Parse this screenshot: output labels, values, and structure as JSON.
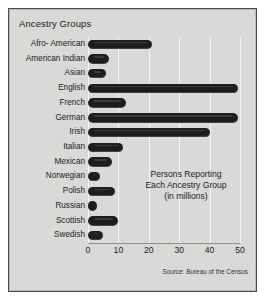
{
  "chart": {
    "title": "Ancestry Groups",
    "annotation_lines": [
      "Persons Reporting",
      "Each Ancestry Group",
      "(in millions)"
    ],
    "source": "Source: Bureau of the Census",
    "bar_color": "#1d1d1d",
    "panel_color": "#d9d9d7",
    "gridline_color": "#f4f4f2",
    "border_color": "#4a4a48"
  },
  "chart_data": {
    "type": "bar",
    "orientation": "horizontal",
    "title": "Ancestry Groups",
    "xlabel": "",
    "ylabel": "",
    "annotation": "Persons Reporting Each Ancestry Group (in millions)",
    "source": "Source: Bureau of the Census",
    "xlim": [
      0,
      50
    ],
    "xticks": [
      0,
      10,
      20,
      30,
      40,
      50
    ],
    "xtick_labels": [
      "0",
      "10",
      "20",
      "30",
      "40",
      "50"
    ],
    "grid": true,
    "legend": false,
    "units": "millions of persons",
    "categories": [
      "Afro- American",
      "American Indian",
      "Asian",
      "English",
      "French",
      "German",
      "Irish",
      "Italian",
      "Mexican",
      "Norwegian",
      "Polish",
      "Russian",
      "Scottish",
      "Swedish"
    ],
    "values": [
      21,
      7,
      6,
      49.5,
      12.5,
      49.5,
      40,
      11.5,
      8,
      4,
      9,
      3,
      10,
      5
    ]
  }
}
